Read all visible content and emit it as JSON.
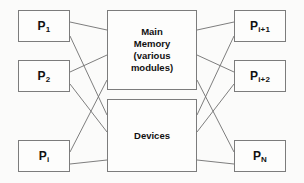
{
  "diagram": {
    "style": {
      "background": "#fbfbfa",
      "box_fill": "#fdfdfc",
      "box_stroke": "#7c7c7c",
      "wire_stroke": "#6f6f6f",
      "text_color": "#111111"
    },
    "left_processors": [
      {
        "id": "p1",
        "base": "P",
        "sub": "1",
        "text": "P1"
      },
      {
        "id": "p2",
        "base": "P",
        "sub": "2",
        "text": "P2"
      },
      {
        "id": "pi",
        "base": "P",
        "sub": "i",
        "text": "Pi"
      }
    ],
    "right_processors": [
      {
        "id": "pi1",
        "base": "P",
        "sub": "i+1",
        "text": "Pi+1"
      },
      {
        "id": "pi2",
        "base": "P",
        "sub": "i+2",
        "text": "Pi+2"
      },
      {
        "id": "pn",
        "base": "P",
        "sub": "N",
        "text": "PN"
      }
    ],
    "hubs": [
      {
        "id": "main-memory",
        "lines": [
          "Main",
          "Memory",
          "(various",
          "modules)"
        ]
      },
      {
        "id": "devices",
        "lines": [
          "Devices"
        ]
      }
    ],
    "connections": {
      "count": 12,
      "description": "Each processor connects to both the Main Memory block and the Devices block via crossing lines"
    }
  }
}
